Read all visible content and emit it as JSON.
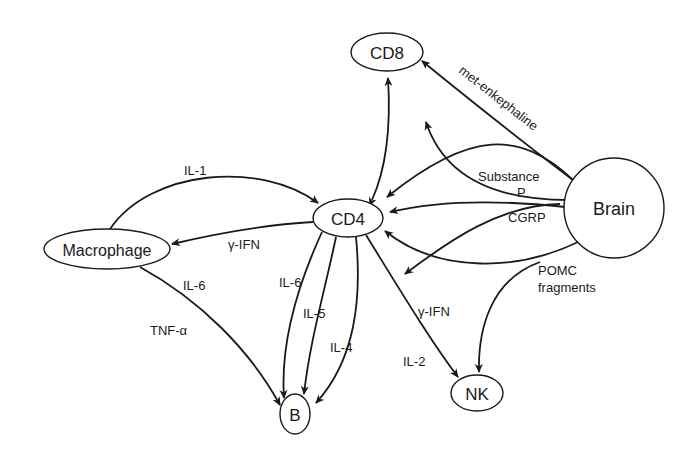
{
  "diagram": {
    "nodes": [
      {
        "id": "cd8",
        "label": "CD8",
        "shape": "ellipse",
        "cx": 387,
        "cy": 52,
        "rx": 36,
        "ry": 19,
        "font_size": 17
      },
      {
        "id": "cd4",
        "label": "CD4",
        "shape": "ellipse",
        "cx": 348,
        "cy": 218,
        "rx": 35,
        "ry": 19,
        "font_size": 17
      },
      {
        "id": "macrophage",
        "label": "Macrophage",
        "shape": "ellipse",
        "cx": 107,
        "cy": 249,
        "rx": 63,
        "ry": 20,
        "font_size": 16
      },
      {
        "id": "brain",
        "label": "Brain",
        "shape": "circle",
        "cx": 614,
        "cy": 208,
        "rx": 50,
        "ry": 50,
        "font_size": 18
      },
      {
        "id": "b",
        "label": "B",
        "shape": "ellipse",
        "cx": 295,
        "cy": 414,
        "rx": 15,
        "ry": 20,
        "font_size": 17
      },
      {
        "id": "nk",
        "label": "NK",
        "shape": "ellipse",
        "cx": 477,
        "cy": 393,
        "rx": 26,
        "ry": 18,
        "font_size": 17
      }
    ],
    "edges": [
      {
        "id": "cd4-cd8",
        "from": "CD4",
        "to": "CD8",
        "bidirectional": true,
        "label": ""
      },
      {
        "id": "macrophage-cd4-il1",
        "from": "Macrophage",
        "to": "CD4",
        "label": "IL-1"
      },
      {
        "id": "cd4-macrophage-ifn",
        "from": "CD4",
        "to": "Macrophage",
        "label": "γ-IFN"
      },
      {
        "id": "macrophage-b",
        "from": "Macrophage",
        "to": "B",
        "label": "IL-6 / TNF-α"
      },
      {
        "id": "cd4-b-il6",
        "from": "CD4",
        "to": "B",
        "label": "IL-6"
      },
      {
        "id": "cd4-b-il5",
        "from": "CD4",
        "to": "B",
        "label": "IL-5"
      },
      {
        "id": "cd4-b-il4",
        "from": "CD4",
        "to": "B",
        "label": "IL-4"
      },
      {
        "id": "cd4-nk",
        "from": "CD4",
        "to": "NK",
        "label": "γ-IFN / IL-2"
      },
      {
        "id": "brain-cd8",
        "from": "Brain",
        "to": "CD8",
        "label": "met-enkephaline"
      },
      {
        "id": "brain-cd4-substance-p",
        "from": "Brain",
        "to": "CD4",
        "label": "Substance P"
      },
      {
        "id": "brain-cd4-cgrp",
        "from": "Brain",
        "to": "CD4",
        "label": "CGRP"
      },
      {
        "id": "brain-cd4-lower",
        "from": "Brain",
        "to": "CD4",
        "label": ""
      },
      {
        "id": "brain-nk",
        "from": "Brain",
        "to": "NK",
        "label": "POMC fragments"
      }
    ],
    "edge_labels": {
      "il1": "IL-1",
      "ifn_macrophage": "γ-IFN",
      "il6_macrophage": "IL-6",
      "tnf": "TNF-α",
      "il6_cd4": "IL-6",
      "il5": "IL-5",
      "il4": "IL-4",
      "ifn_nk": "γ-IFN",
      "il2": "IL-2",
      "met_enkephaline": "met-enkephaline",
      "substance": "Substance",
      "p": "P",
      "cgrp": "CGRP",
      "pomc": "POMC",
      "fragments": "fragments"
    }
  }
}
